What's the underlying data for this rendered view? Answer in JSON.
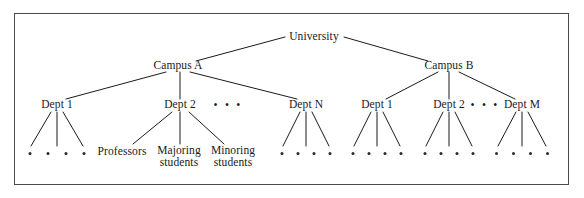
{
  "figure": {
    "type": "tree-diagram",
    "background": "#ffffff",
    "frame_color": "#4a4a4a",
    "line_color": "#1a1a1a",
    "text_color": "#1a1a1a"
  },
  "nodes": {
    "root": {
      "label": "University",
      "x": 314,
      "y": 37
    },
    "campus_a": {
      "label": "Campus A",
      "x": 178,
      "y": 66
    },
    "campus_b": {
      "label": "Campus B",
      "x": 449,
      "y": 66
    },
    "a_dept1": {
      "label": "Dept 1",
      "x": 57,
      "y": 105
    },
    "a_dept2": {
      "label": "Dept 2",
      "x": 180,
      "y": 105
    },
    "a_deptn": {
      "label": "Dept N",
      "x": 306,
      "y": 105
    },
    "b_dept1": {
      "label": "Dept 1",
      "x": 377,
      "y": 105
    },
    "b_dept2": {
      "label": "Dept 2",
      "x": 449,
      "y": 105
    },
    "b_deptm": {
      "label": "Dept M",
      "x": 522,
      "y": 105
    },
    "professors": {
      "label": "Professors",
      "x": 122,
      "y": 152
    },
    "majoring": {
      "label_line1": "Majoring",
      "label_line2": "students",
      "x": 179,
      "y": 157
    },
    "minoring": {
      "label_line1": "Minoring",
      "label_line2": "students",
      "x": 233,
      "y": 157
    }
  },
  "ellipses": [
    {
      "name": "campus-a-dept-ellipsis",
      "label": "• • •",
      "x": 228,
      "y": 105
    },
    {
      "name": "campus-b-dept-ellipsis",
      "label": "• • •",
      "x": 485,
      "y": 105
    }
  ],
  "leaf_dot_groups": [
    {
      "name": "a-dept1-leaves",
      "count": 4,
      "x": 57,
      "y": 152,
      "spacing": 18
    },
    {
      "name": "a-deptn-leaves",
      "count": 4,
      "x": 306,
      "y": 152,
      "spacing": 16
    },
    {
      "name": "b-dept1-leaves",
      "count": 4,
      "x": 377,
      "y": 152,
      "spacing": 16
    },
    {
      "name": "b-dept2-leaves",
      "count": 4,
      "x": 449,
      "y": 152,
      "spacing": 16
    },
    {
      "name": "b-deptm-leaves",
      "count": 4,
      "x": 522,
      "y": 152,
      "spacing": 17
    }
  ],
  "edges": [
    {
      "name": "university-to-campus-a",
      "x1": 285,
      "y1": 37,
      "x2": 196,
      "y2": 61
    },
    {
      "name": "university-to-campus-b",
      "x1": 344,
      "y1": 37,
      "x2": 428,
      "y2": 61
    },
    {
      "name": "campus-a-to-dept1",
      "x1": 166,
      "y1": 72,
      "x2": 66,
      "y2": 99
    },
    {
      "name": "campus-a-to-dept2",
      "x1": 180,
      "y1": 72,
      "x2": 180,
      "y2": 99
    },
    {
      "name": "campus-a-to-deptn",
      "x1": 190,
      "y1": 72,
      "x2": 297,
      "y2": 99
    },
    {
      "name": "campus-b-to-dept1",
      "x1": 438,
      "y1": 72,
      "x2": 386,
      "y2": 99
    },
    {
      "name": "campus-b-to-dept2",
      "x1": 449,
      "y1": 72,
      "x2": 449,
      "y2": 99
    },
    {
      "name": "campus-b-to-deptm",
      "x1": 459,
      "y1": 72,
      "x2": 515,
      "y2": 99
    },
    {
      "name": "a-dept1-leaf-1",
      "x1": 51,
      "y1": 112,
      "x2": 31,
      "y2": 146
    },
    {
      "name": "a-dept1-leaf-2",
      "x1": 57,
      "y1": 112,
      "x2": 57,
      "y2": 146
    },
    {
      "name": "a-dept1-leaf-3",
      "x1": 63,
      "y1": 112,
      "x2": 83,
      "y2": 146
    },
    {
      "name": "a-dept2-to-professors",
      "x1": 172,
      "y1": 112,
      "x2": 133,
      "y2": 144
    },
    {
      "name": "a-dept2-to-majoring",
      "x1": 180,
      "y1": 112,
      "x2": 180,
      "y2": 144
    },
    {
      "name": "a-dept2-to-minoring",
      "x1": 189,
      "y1": 112,
      "x2": 224,
      "y2": 144
    },
    {
      "name": "a-deptn-leaf-1",
      "x1": 300,
      "y1": 112,
      "x2": 283,
      "y2": 146
    },
    {
      "name": "a-deptn-leaf-2",
      "x1": 306,
      "y1": 112,
      "x2": 306,
      "y2": 146
    },
    {
      "name": "a-deptn-leaf-3",
      "x1": 312,
      "y1": 112,
      "x2": 329,
      "y2": 146
    },
    {
      "name": "b-dept1-leaf-1",
      "x1": 371,
      "y1": 112,
      "x2": 354,
      "y2": 146
    },
    {
      "name": "b-dept1-leaf-2",
      "x1": 377,
      "y1": 112,
      "x2": 377,
      "y2": 146
    },
    {
      "name": "b-dept1-leaf-3",
      "x1": 383,
      "y1": 112,
      "x2": 400,
      "y2": 146
    },
    {
      "name": "b-dept2-leaf-1",
      "x1": 443,
      "y1": 112,
      "x2": 426,
      "y2": 146
    },
    {
      "name": "b-dept2-leaf-2",
      "x1": 449,
      "y1": 112,
      "x2": 449,
      "y2": 146
    },
    {
      "name": "b-dept2-leaf-3",
      "x1": 455,
      "y1": 112,
      "x2": 472,
      "y2": 146
    },
    {
      "name": "b-deptm-leaf-1",
      "x1": 516,
      "y1": 112,
      "x2": 498,
      "y2": 146
    },
    {
      "name": "b-deptm-leaf-2",
      "x1": 522,
      "y1": 112,
      "x2": 522,
      "y2": 146
    },
    {
      "name": "b-deptm-leaf-3",
      "x1": 528,
      "y1": 112,
      "x2": 546,
      "y2": 146
    }
  ]
}
